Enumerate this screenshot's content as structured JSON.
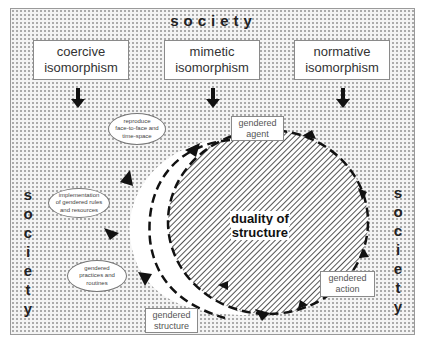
{
  "diagram": {
    "frame_label_top": "society",
    "frame_label_left": [
      "s",
      "o",
      "c",
      "i",
      "e",
      "t",
      "y"
    ],
    "frame_label_right": [
      "s",
      "o",
      "c",
      "i",
      "e",
      "t",
      "y"
    ],
    "isomorphisms": [
      {
        "line1": "coercive",
        "line2": "isomorphism"
      },
      {
        "line1": "mimetic",
        "line2": "isomorphism"
      },
      {
        "line1": "normative",
        "line2": "isomorphism"
      }
    ],
    "center": {
      "line1": "duality of",
      "line2": "structure"
    },
    "cycle_nodes": [
      {
        "line1": "gendered",
        "line2": "agent"
      },
      {
        "line1": "gendered",
        "line2": "action"
      },
      {
        "line1": "gendered",
        "line2": "structure"
      }
    ],
    "ovals": [
      {
        "line1": "reproduce",
        "line2": "face-to-face and",
        "line3": "time-space"
      },
      {
        "line1": "implementation",
        "line2": "of gendered rules",
        "line3": "and resources"
      },
      {
        "line1": "gendered",
        "line2": "practices and",
        "line3": "routines"
      }
    ],
    "colors": {
      "background_dots": "#a8a8a8",
      "hatch": "#555555",
      "arrows": "#111111"
    }
  }
}
